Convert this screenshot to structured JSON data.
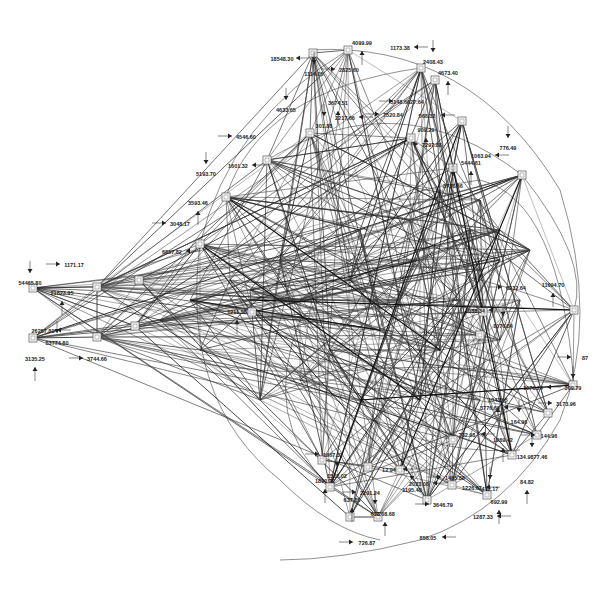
{
  "diagram": {
    "type": "network-flow-graph",
    "background": "#ffffff",
    "edge_color": "#333333",
    "node_color": "#555555",
    "nodes": [
      {
        "id": "n1",
        "x": 33,
        "y": 288
      },
      {
        "id": "n2",
        "x": 97,
        "y": 287
      },
      {
        "id": "n3",
        "x": 139,
        "y": 280
      },
      {
        "id": "n4",
        "x": 33,
        "y": 338
      },
      {
        "id": "n5",
        "x": 97,
        "y": 337
      },
      {
        "id": "n6",
        "x": 135,
        "y": 326
      },
      {
        "id": "n7",
        "x": 200,
        "y": 244
      },
      {
        "id": "n8",
        "x": 226,
        "y": 197
      },
      {
        "id": "n9",
        "x": 267,
        "y": 160
      },
      {
        "id": "n10",
        "x": 310,
        "y": 133
      },
      {
        "id": "n11",
        "x": 313,
        "y": 53
      },
      {
        "id": "n12",
        "x": 348,
        "y": 50
      },
      {
        "id": "n13",
        "x": 421,
        "y": 68
      },
      {
        "id": "n14",
        "x": 435,
        "y": 80
      },
      {
        "id": "n15",
        "x": 462,
        "y": 121
      },
      {
        "id": "n16",
        "x": 411,
        "y": 138
      },
      {
        "id": "n17",
        "x": 453,
        "y": 168
      },
      {
        "id": "n18",
        "x": 522,
        "y": 175
      },
      {
        "id": "n19",
        "x": 574,
        "y": 310
      },
      {
        "id": "n20",
        "x": 573,
        "y": 385
      },
      {
        "id": "n21",
        "x": 548,
        "y": 413
      },
      {
        "id": "n22",
        "x": 537,
        "y": 435
      },
      {
        "id": "n23",
        "x": 512,
        "y": 455
      },
      {
        "id": "n24",
        "x": 453,
        "y": 440
      },
      {
        "id": "n25",
        "x": 487,
        "y": 495
      },
      {
        "id": "n26",
        "x": 427,
        "y": 500
      },
      {
        "id": "n27",
        "x": 400,
        "y": 470
      },
      {
        "id": "n28",
        "x": 378,
        "y": 517
      },
      {
        "id": "n29",
        "x": 350,
        "y": 517
      },
      {
        "id": "n30",
        "x": 330,
        "y": 487
      },
      {
        "id": "n31",
        "x": 322,
        "y": 460
      },
      {
        "id": "n32",
        "x": 368,
        "y": 467
      },
      {
        "id": "n33",
        "x": 452,
        "y": 485
      },
      {
        "id": "n34",
        "x": 252,
        "y": 312
      },
      {
        "id": "n35",
        "x": 483,
        "y": 312
      },
      {
        "id": "n36",
        "x": 480,
        "y": 335
      }
    ],
    "labels": [
      {
        "text": "54465.80",
        "x": 30,
        "y": 285
      },
      {
        "text": "21823.95",
        "x": 62,
        "y": 295
      },
      {
        "text": "1171.17",
        "x": 74,
        "y": 267
      },
      {
        "text": "26257.80",
        "x": 43,
        "y": 333
      },
      {
        "text": "53774.80",
        "x": 57,
        "y": 345
      },
      {
        "text": "3135.25",
        "x": 35,
        "y": 361
      },
      {
        "text": "3744.66",
        "x": 97,
        "y": 361
      },
      {
        "text": "18548.30",
        "x": 282,
        "y": 61
      },
      {
        "text": "1114.05",
        "x": 314,
        "y": 76
      },
      {
        "text": "4099.99",
        "x": 362,
        "y": 45
      },
      {
        "text": "2825.60",
        "x": 349,
        "y": 72
      },
      {
        "text": "1173.38",
        "x": 400,
        "y": 50
      },
      {
        "text": "2408.43",
        "x": 433,
        "y": 64
      },
      {
        "text": "4673.40",
        "x": 448,
        "y": 75
      },
      {
        "text": "5148.6627.64",
        "x": 407,
        "y": 104
      },
      {
        "text": "568.32",
        "x": 427,
        "y": 118
      },
      {
        "text": "4633.65",
        "x": 286,
        "y": 112
      },
      {
        "text": "3674.51",
        "x": 338,
        "y": 105
      },
      {
        "text": "7520.84",
        "x": 393,
        "y": 117
      },
      {
        "text": "2217.66",
        "x": 345,
        "y": 120
      },
      {
        "text": "301.88",
        "x": 324,
        "y": 128
      },
      {
        "text": "909.29",
        "x": 426,
        "y": 132
      },
      {
        "text": "7297.88",
        "x": 432,
        "y": 147
      },
      {
        "text": "1063.94",
        "x": 481,
        "y": 158
      },
      {
        "text": "776.49",
        "x": 508,
        "y": 150
      },
      {
        "text": "5444.61",
        "x": 471,
        "y": 165
      },
      {
        "text": "4546.60",
        "x": 246,
        "y": 139
      },
      {
        "text": "1601.32",
        "x": 238,
        "y": 168
      },
      {
        "text": "5193.70",
        "x": 206,
        "y": 176
      },
      {
        "text": "3593.46",
        "x": 198,
        "y": 205
      },
      {
        "text": "3048.17",
        "x": 180,
        "y": 226
      },
      {
        "text": "6857.82",
        "x": 172,
        "y": 254
      },
      {
        "text": "3736.66",
        "x": 453,
        "y": 188
      },
      {
        "text": "11694.70",
        "x": 553,
        "y": 287
      },
      {
        "text": "6232.64",
        "x": 516,
        "y": 290
      },
      {
        "text": "1088.34",
        "x": 475,
        "y": 313
      },
      {
        "text": "1076.84",
        "x": 503,
        "y": 328
      },
      {
        "text": "1211.58",
        "x": 237,
        "y": 314
      },
      {
        "text": "87",
        "x": 585,
        "y": 360
      },
      {
        "text": "1076.24",
        "x": 533,
        "y": 390
      },
      {
        "text": "309.79",
        "x": 573,
        "y": 390
      },
      {
        "text": "1043.65",
        "x": 498,
        "y": 402
      },
      {
        "text": "3173.96",
        "x": 566,
        "y": 406
      },
      {
        "text": "3776.69",
        "x": 490,
        "y": 410
      },
      {
        "text": "164.96",
        "x": 519,
        "y": 424
      },
      {
        "text": "1269.42",
        "x": 503,
        "y": 442
      },
      {
        "text": "144.96",
        "x": 549,
        "y": 438
      },
      {
        "text": "782.98",
        "x": 467,
        "y": 437
      },
      {
        "text": "134.9877.46",
        "x": 532,
        "y": 459
      },
      {
        "text": "84.82",
        "x": 527,
        "y": 484
      },
      {
        "text": "1667.32",
        "x": 333,
        "y": 457
      },
      {
        "text": "12.94",
        "x": 389,
        "y": 472
      },
      {
        "text": "1517.02",
        "x": 337,
        "y": 478
      },
      {
        "text": "1890.72",
        "x": 325,
        "y": 483
      },
      {
        "text": "2291.24",
        "x": 370,
        "y": 495
      },
      {
        "text": "2023.08",
        "x": 419,
        "y": 486
      },
      {
        "text": "1195.40",
        "x": 412,
        "y": 492
      },
      {
        "text": "637.85",
        "x": 352,
        "y": 502
      },
      {
        "text": "1465.88",
        "x": 455,
        "y": 480
      },
      {
        "text": "1226.67",
        "x": 472,
        "y": 490
      },
      {
        "text": "472.17",
        "x": 490,
        "y": 491
      },
      {
        "text": "692.99",
        "x": 499,
        "y": 504
      },
      {
        "text": "3646.79",
        "x": 443,
        "y": 507
      },
      {
        "text": "1287.33",
        "x": 483,
        "y": 519
      },
      {
        "text": "617",
        "x": 375,
        "y": 516
      },
      {
        "text": "4208.68",
        "x": 385,
        "y": 516
      },
      {
        "text": "726.87",
        "x": 367,
        "y": 545
      },
      {
        "text": "858.05",
        "x": 428,
        "y": 540
      }
    ]
  }
}
